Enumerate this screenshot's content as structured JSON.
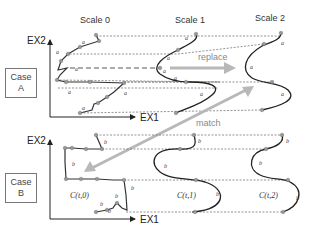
{
  "scales": [
    "Scale 0",
    "Scale 1",
    "Scale 2"
  ],
  "axes": {
    "x": "EX1",
    "y": "EX2"
  },
  "cases": [
    {
      "line1": "Case",
      "line2": "A"
    },
    {
      "line1": "Case",
      "line2": "B"
    }
  ],
  "arrows": {
    "replace": "replace",
    "match": "match"
  },
  "curve_labels": [
    "C(t,0)",
    "C(t,1)",
    "C(t,2)"
  ],
  "segment_labels": {
    "caseA": {
      "scale0": [
        "a",
        "a",
        "a",
        "a",
        "a",
        "a"
      ],
      "scale1": [
        "a",
        "a",
        "a",
        "a",
        "a"
      ],
      "scale2": [
        "a",
        "a",
        "a"
      ]
    },
    "caseB": {
      "scale0": [
        "b",
        "b",
        "b",
        "b",
        "b",
        "b"
      ],
      "scale1": [
        "b",
        "b",
        "b",
        "b"
      ],
      "scale2": [
        "b",
        "b",
        "b"
      ]
    }
  },
  "colors": {
    "curve": "#222222",
    "point": "#999999",
    "arrow": "#b8b8b8",
    "dashed": "#666666"
  }
}
